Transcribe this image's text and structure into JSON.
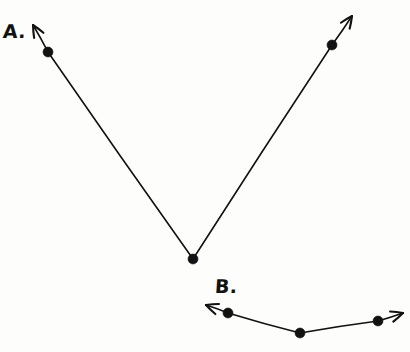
{
  "figure": {
    "background_color": "#fdfdfc",
    "ink_color": "#121212",
    "stroke_width": 1.6,
    "dot_radius": 5,
    "width": 410,
    "height": 352
  },
  "labels": {
    "a": "A.",
    "b": "B."
  },
  "chart_data": {
    "type": "scatter",
    "xlabel": "",
    "ylabel": "",
    "xlim": [
      0,
      410
    ],
    "ylim": [
      352,
      0
    ],
    "grid": false,
    "legend": "none",
    "series": [
      {
        "name": "A.",
        "label_position": [
          3,
          22
        ],
        "points": [
          {
            "x": 48,
            "y": 52
          },
          {
            "x": 193,
            "y": 259
          },
          {
            "x": 332,
            "y": 45
          }
        ],
        "arrowheads": [
          {
            "from": [
              48,
              52
            ],
            "to": [
              33,
              25
            ]
          },
          {
            "from": [
              332,
              45
            ],
            "to": [
              352,
              16
            ]
          }
        ]
      },
      {
        "name": "B.",
        "label_position": [
          215,
          277
        ],
        "points": [
          {
            "x": 228,
            "y": 313
          },
          {
            "x": 300,
            "y": 333
          },
          {
            "x": 378,
            "y": 321
          }
        ],
        "arrowheads": [
          {
            "from": [
              228,
              313
            ],
            "to": [
              206,
              305
            ]
          },
          {
            "from": [
              378,
              321
            ],
            "to": [
              403,
              313
            ]
          }
        ]
      }
    ]
  }
}
